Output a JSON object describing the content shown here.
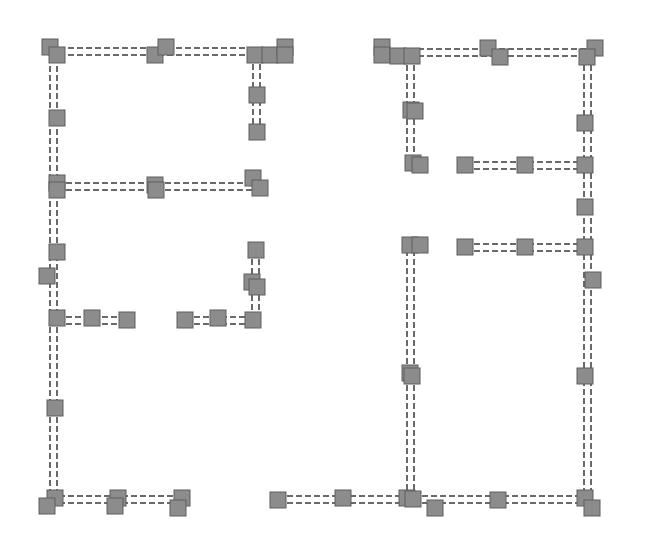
{
  "diagram": {
    "type": "floor-plan-graph",
    "width": 650,
    "height": 546,
    "colors": {
      "background": "#ffffff",
      "wall": "#6a6a6a",
      "node_fill": "#8c8c8c",
      "node_stroke": "#5e5e5e"
    },
    "node_size": 16,
    "wall_gap": 7,
    "walls": [
      {
        "id": "L-top",
        "x1": 50,
        "y1": 48,
        "x2": 290,
        "y2": 48,
        "orient": "h"
      },
      {
        "id": "L-left",
        "x1": 50,
        "y1": 48,
        "x2": 50,
        "y2": 500,
        "orient": "v"
      },
      {
        "id": "L-right-stub",
        "x1": 253,
        "y1": 55,
        "x2": 253,
        "y2": 133,
        "orient": "v"
      },
      {
        "id": "L-mid",
        "x1": 57,
        "y1": 183,
        "x2": 258,
        "y2": 183,
        "orient": "h"
      },
      {
        "id": "L-stub-a",
        "x1": 57,
        "y1": 317,
        "x2": 127,
        "y2": 317,
        "orient": "h"
      },
      {
        "id": "L-stub-b",
        "x1": 185,
        "y1": 317,
        "x2": 255,
        "y2": 317,
        "orient": "h"
      },
      {
        "id": "L-stub-c",
        "x1": 252,
        "y1": 250,
        "x2": 252,
        "y2": 320,
        "orient": "v"
      },
      {
        "id": "L-bottom",
        "x1": 50,
        "y1": 496,
        "x2": 182,
        "y2": 496,
        "orient": "h"
      },
      {
        "id": "R-top",
        "x1": 382,
        "y1": 49,
        "x2": 595,
        "y2": 49,
        "orient": "h"
      },
      {
        "id": "R-inner-v",
        "x1": 407,
        "y1": 56,
        "x2": 407,
        "y2": 165,
        "orient": "v"
      },
      {
        "id": "R-right",
        "x1": 584,
        "y1": 56,
        "x2": 584,
        "y2": 500,
        "orient": "v"
      },
      {
        "id": "R-row1",
        "x1": 465,
        "y1": 162,
        "x2": 585,
        "y2": 162,
        "orient": "h"
      },
      {
        "id": "R-row2",
        "x1": 465,
        "y1": 244,
        "x2": 585,
        "y2": 244,
        "orient": "h"
      },
      {
        "id": "R-mid-v",
        "x1": 407,
        "y1": 250,
        "x2": 407,
        "y2": 500,
        "orient": "v"
      },
      {
        "id": "R-bottom",
        "x1": 278,
        "y1": 496,
        "x2": 592,
        "y2": 496,
        "orient": "h"
      }
    ],
    "nodes": [
      [
        50,
        47
      ],
      [
        57,
        55
      ],
      [
        155,
        55
      ],
      [
        166,
        47
      ],
      [
        255,
        55
      ],
      [
        270,
        55
      ],
      [
        285,
        47
      ],
      [
        285,
        55
      ],
      [
        57,
        118
      ],
      [
        257,
        95
      ],
      [
        257,
        132
      ],
      [
        57,
        183
      ],
      [
        57,
        190
      ],
      [
        155,
        185
      ],
      [
        156,
        190
      ],
      [
        253,
        178
      ],
      [
        260,
        188
      ],
      [
        57,
        252
      ],
      [
        47,
        276
      ],
      [
        57,
        318
      ],
      [
        92,
        318
      ],
      [
        127,
        320
      ],
      [
        185,
        320
      ],
      [
        218,
        318
      ],
      [
        253,
        320
      ],
      [
        256,
        250
      ],
      [
        252,
        282
      ],
      [
        257,
        287
      ],
      [
        55,
        408
      ],
      [
        55,
        498
      ],
      [
        47,
        506
      ],
      [
        118,
        498
      ],
      [
        115,
        506
      ],
      [
        182,
        498
      ],
      [
        178,
        508
      ],
      [
        382,
        47
      ],
      [
        382,
        55
      ],
      [
        398,
        56
      ],
      [
        412,
        56
      ],
      [
        488,
        48
      ],
      [
        500,
        57
      ],
      [
        595,
        48
      ],
      [
        587,
        57
      ],
      [
        411,
        110
      ],
      [
        415,
        111
      ],
      [
        413,
        163
      ],
      [
        420,
        165
      ],
      [
        465,
        165
      ],
      [
        525,
        165
      ],
      [
        585,
        165
      ],
      [
        585,
        123
      ],
      [
        585,
        207
      ],
      [
        410,
        245
      ],
      [
        420,
        245
      ],
      [
        465,
        247
      ],
      [
        525,
        247
      ],
      [
        585,
        247
      ],
      [
        593,
        280
      ],
      [
        410,
        373
      ],
      [
        412,
        376
      ],
      [
        585,
        376
      ],
      [
        278,
        500
      ],
      [
        343,
        498
      ],
      [
        407,
        498
      ],
      [
        413,
        499
      ],
      [
        435,
        508
      ],
      [
        498,
        500
      ],
      [
        585,
        498
      ],
      [
        592,
        508
      ]
    ]
  }
}
